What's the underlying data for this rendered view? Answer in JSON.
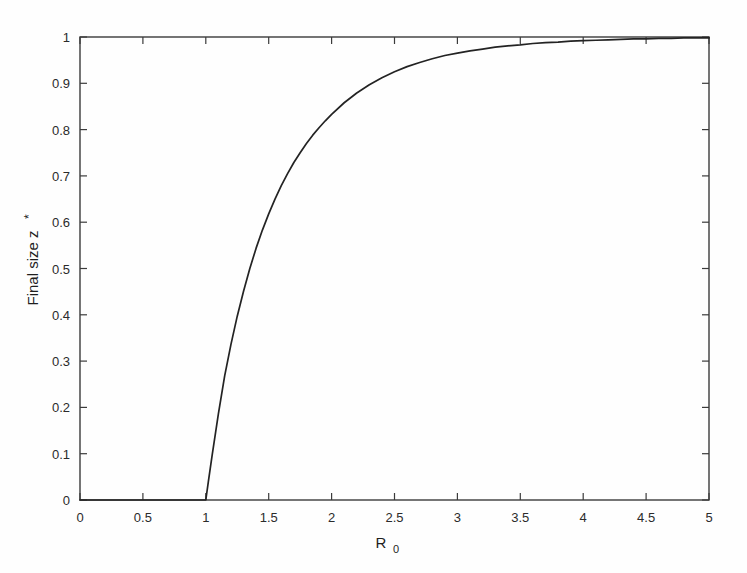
{
  "figure": {
    "background_color": "#fefefe",
    "axis_color": "#3b3b3b",
    "curve_color": "#232323"
  },
  "chart_data": {
    "type": "line",
    "title": "",
    "subtitle": "",
    "xlabel": "R_0",
    "xlabel_base": "R",
    "xlabel_subscript": "0",
    "ylabel": "Final size z*",
    "ylabel_base": "Final size z",
    "ylabel_superscript": "*",
    "xlim": [
      0,
      5
    ],
    "ylim": [
      0,
      1
    ],
    "grid": false,
    "legend": null,
    "legend_position": "none",
    "xticks": [
      0,
      0.5,
      1,
      1.5,
      2,
      2.5,
      3,
      3.5,
      4,
      4.5,
      5
    ],
    "xticklabels": [
      "0",
      "0.5",
      "1",
      "1.5",
      "2",
      "2.5",
      "3",
      "3.5",
      "4",
      "4.5",
      "5"
    ],
    "yticks": [
      0,
      0.1,
      0.2,
      0.3,
      0.4,
      0.5,
      0.6,
      0.7,
      0.8,
      0.9,
      1
    ],
    "yticklabels": [
      "0",
      "0.1",
      "0.2",
      "0.3",
      "0.4",
      "0.5",
      "0.6",
      "0.7",
      "0.8",
      "0.9",
      "1"
    ],
    "tick_direction": "in",
    "box": true,
    "annotations": [],
    "series": [
      {
        "name": "Final size",
        "description": "Epidemic final size z* solving z* = 1 - exp(-R_0 z*); zero below the threshold R_0 = 1",
        "x": [
          0,
          0.1,
          0.2,
          0.3,
          0.4,
          0.5,
          0.6,
          0.7,
          0.8,
          0.9,
          0.95,
          1.0,
          1.02,
          1.05,
          1.1,
          1.15,
          1.2,
          1.25,
          1.3,
          1.35,
          1.4,
          1.45,
          1.5,
          1.55,
          1.6,
          1.65,
          1.7,
          1.75,
          1.8,
          1.85,
          1.9,
          1.95,
          2.0,
          2.1,
          2.2,
          2.3,
          2.4,
          2.5,
          2.6,
          2.7,
          2.8,
          2.9,
          3.0,
          3.1,
          3.2,
          3.3,
          3.4,
          3.5,
          3.6,
          3.7,
          3.8,
          3.9,
          4.0,
          4.1,
          4.2,
          4.3,
          4.4,
          4.5,
          4.6,
          4.7,
          4.8,
          4.9,
          5.0
        ],
        "y": [
          0,
          0,
          0,
          0,
          0,
          0,
          0,
          0,
          0,
          0,
          0,
          0,
          0.039,
          0.096,
          0.186,
          0.268,
          0.336,
          0.397,
          0.451,
          0.5,
          0.544,
          0.583,
          0.618,
          0.65,
          0.679,
          0.705,
          0.729,
          0.75,
          0.77,
          0.788,
          0.804,
          0.819,
          0.833,
          0.858,
          0.879,
          0.897,
          0.912,
          0.925,
          0.936,
          0.945,
          0.953,
          0.96,
          0.965,
          0.97,
          0.974,
          0.978,
          0.981,
          0.983,
          0.986,
          0.988,
          0.989,
          0.991,
          0.992,
          0.993,
          0.994,
          0.995,
          0.996,
          0.996,
          0.997,
          0.997,
          0.998,
          0.998,
          0.998
        ]
      }
    ]
  }
}
